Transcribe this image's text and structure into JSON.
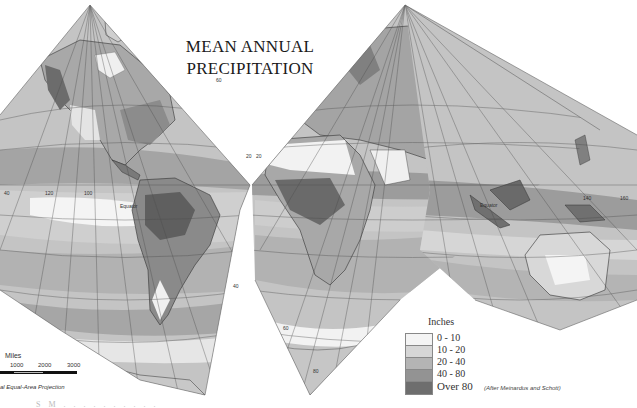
{
  "map": {
    "title_line1": "MEAN ANNUAL",
    "title_line2": "PRECIPITATION",
    "projection_label": "al Equal-Area Projection",
    "credit": "(After Meinardus and Schott)",
    "equator_label_west": "Equator",
    "equator_label_east": "Equator",
    "graticule_labels": {
      "lat_60_west": "60",
      "lat_40_mid": "40",
      "lat_20_mid_left": "20",
      "lat_20_mid_right": "20",
      "lon_160_west": "160",
      "lon_120_west": "120",
      "lon_100_west": "100",
      "lon_60_west": "40",
      "lon_140_east": "140",
      "lon_160_east": "160",
      "lat_60_south": "60",
      "lat_40_south": "40",
      "lat_80_south": "80",
      "lat_60_east": "60"
    },
    "scale": {
      "title": "Miles",
      "ticks": [
        "1000",
        "2000",
        "3000"
      ]
    },
    "caption_fragment": "S M . . . . . . . . . ."
  },
  "legend": {
    "title": "Inches",
    "items": [
      {
        "label": "0 - 10",
        "color": "#f4f4f4"
      },
      {
        "label": "10 - 20",
        "color": "#d6d6d6"
      },
      {
        "label": "20 - 40",
        "color": "#b4b4b4"
      },
      {
        "label": "40 - 80",
        "color": "#939393"
      },
      {
        "label": "Over 80",
        "color": "#6e6e6e"
      }
    ]
  },
  "colors": {
    "ocean_light": "#d2d2d2",
    "ocean_mid": "#b8b8b8",
    "ocean_dark": "#a0a0a0",
    "land_dry": "#eeeeee",
    "land_mid": "#a9a9a9",
    "land_wet": "#808080",
    "land_vwet": "#5f5f5f",
    "grid": "#555555",
    "coast": "#333333"
  }
}
